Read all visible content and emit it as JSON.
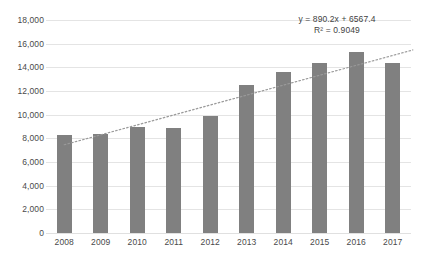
{
  "chart_data": {
    "type": "bar",
    "title": "",
    "xlabel": "",
    "ylabel": "",
    "categories": [
      "2008",
      "2009",
      "2010",
      "2011",
      "2012",
      "2013",
      "2014",
      "2015",
      "2016",
      "2017"
    ],
    "values": [
      8250,
      8350,
      9000,
      8900,
      9850,
      12550,
      13600,
      14350,
      15300,
      14350
    ],
    "series": [
      {
        "name": "Series 1",
        "values": [
          8250,
          8350,
          9000,
          8900,
          9850,
          12550,
          13600,
          14350,
          15300,
          14350
        ],
        "color": "#808080"
      }
    ],
    "ylim": [
      0,
      18000
    ],
    "yticks": [
      0,
      2000,
      4000,
      6000,
      8000,
      10000,
      12000,
      14000,
      16000,
      18000
    ],
    "ytick_labels": [
      "0",
      "2,000",
      "4,000",
      "6,000",
      "8,000",
      "10,000",
      "12,000",
      "14,000",
      "16,000",
      "18,000"
    ],
    "grid": true,
    "legend": "none",
    "trendline": {
      "type": "linear",
      "style": "dotted",
      "color": "#9a9a9a",
      "slope": 890.2,
      "intercept": 6567.4,
      "r_squared": 0.9049,
      "equation_label": "y = 890.2x + 6567.4",
      "r_squared_label": "R² = 0.9049",
      "start_value": 7457.6,
      "end_value": 15469.4
    },
    "annotations": [
      "y = 890.2x + 6567.4",
      "R² = 0.9049"
    ]
  },
  "colors": {
    "bar": "#808080",
    "gridline": "#e4e4e4",
    "trendline": "#9a9a9a",
    "text": "#4a4a4a",
    "background": "#ffffff"
  }
}
